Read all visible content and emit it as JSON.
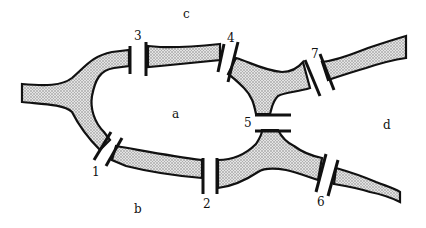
{
  "diagram": {
    "regions": [
      {
        "id": "a",
        "label": "a",
        "x": 172,
        "y": 108
      },
      {
        "id": "b",
        "label": "b",
        "x": 134,
        "y": 203
      },
      {
        "id": "c",
        "label": "c",
        "x": 183,
        "y": 8
      },
      {
        "id": "d",
        "label": "d",
        "x": 383,
        "y": 119
      }
    ],
    "bridges": [
      {
        "id": "1",
        "label": "1",
        "x": 92,
        "y": 166
      },
      {
        "id": "2",
        "label": "2",
        "x": 203,
        "y": 198
      },
      {
        "id": "3",
        "label": "3",
        "x": 134,
        "y": 30
      },
      {
        "id": "4",
        "label": "4",
        "x": 227,
        "y": 32
      },
      {
        "id": "5",
        "label": "5",
        "x": 244,
        "y": 117
      },
      {
        "id": "6",
        "label": "6",
        "x": 317,
        "y": 196
      },
      {
        "id": "7",
        "label": "7",
        "x": 311,
        "y": 48
      }
    ],
    "colors": {
      "river_fill": "#c8c8c8",
      "river_outline": "#111111",
      "bridge": "#111111",
      "background": "#ffffff"
    }
  }
}
